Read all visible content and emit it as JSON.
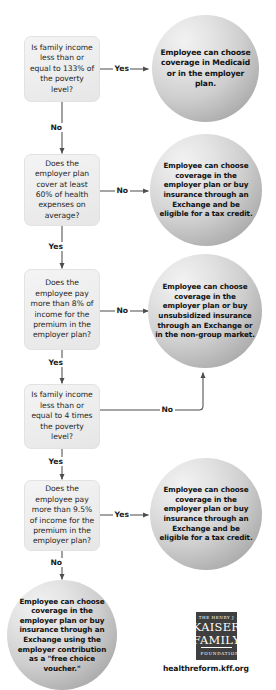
{
  "meta": {
    "background_color": "#ffffff",
    "box_fill": "#eeeeee",
    "circle_fill": "#cfcfcf",
    "line_color": "#4d4d4d"
  },
  "decisions": [
    {
      "id": "income-133",
      "text": "Is family income less than or equal to 133% of the poverty level?",
      "yes_label": "Yes",
      "no_label": "No"
    },
    {
      "id": "plan-60-percent",
      "text": "Does the employer plan cover at least 60% of health expenses on average?",
      "yes_label": "Yes",
      "no_label": "No"
    },
    {
      "id": "premium-8-percent",
      "text": "Does the employee pay more than 8% of income for the premium in the employer plan?",
      "yes_label": "Yes",
      "no_label": "No"
    },
    {
      "id": "income-4-times",
      "text": "Is family income less than or equal to 4 times the poverty level?",
      "yes_label": "Yes",
      "no_label": "No"
    },
    {
      "id": "premium-95-percent",
      "text": "Does the employee pay more than 9.5% of income for the premium in the employer plan?",
      "yes_label": "Yes",
      "no_label": "No"
    }
  ],
  "outcomes": [
    {
      "id": "medicaid-or-employer",
      "text": "Employee can choose coverage in Medicaid or in the employer plan."
    },
    {
      "id": "exchange-tax-credit-1",
      "text": "Employee can choose coverage in the employer plan or buy insurance through an Exchange and be eligible for a tax credit."
    },
    {
      "id": "unsubsidized-exchange",
      "text": "Employee can choose coverage in the employer plan or buy unsubsidized insurance through an Exchange or in the non-group market."
    },
    {
      "id": "exchange-tax-credit-2",
      "text": "Employee can choose coverage in the employer plan or buy insurance through an Exchange and be eligible for a tax credit."
    },
    {
      "id": "free-choice-voucher",
      "text": "Employee can choose coverage in  the employer plan or buy insurance through an Exchange using the employer contribution as a \"free choice voucher.\""
    }
  ],
  "branch_labels": {
    "yes1": "Yes",
    "no1": "No",
    "no2": "No",
    "yes2": "Yes",
    "no3": "No",
    "yes3": "Yes",
    "no4": "No",
    "yes4": "Yes",
    "yes5": "Yes",
    "no5": "No"
  },
  "footer": {
    "logo_line1": "THE HENRY J",
    "logo_line2": "KAISER",
    "logo_line3": "FAMILY",
    "logo_line4": "FOUNDATION",
    "url": "healthreform.kff.org"
  }
}
